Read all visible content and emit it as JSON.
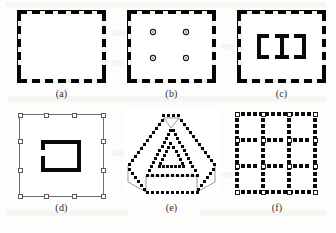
{
  "figure": {
    "background_color": "#fdfdfc",
    "ink_color": "#000000",
    "label_color": "#2b2b2b",
    "columns": 3,
    "rows": 2,
    "panel_count": 6
  },
  "panels": [
    {
      "id": "a",
      "label": "(a)",
      "shape_name": "dashed-rectangle",
      "description": "Landscape rectangle outlined with a thick black band broken by regular white dashes",
      "x": 17,
      "y": 10,
      "width": 89,
      "height": 73,
      "border_style": "thick-dashed-band",
      "border_thickness_px": 5,
      "dash_count_top": 12,
      "dash_count_side": 9,
      "interior": "empty",
      "interior_markers": 0
    },
    {
      "id": "b",
      "label": "(b)",
      "shape_name": "dashed-rectangle-with-four-dots",
      "description": "Same dashed rectangle border with four small hollow ring markers arranged in a 2 by 2 block inside",
      "x": 127,
      "y": 10,
      "width": 89,
      "height": 73,
      "border_style": "thick-dashed-band",
      "border_thickness_px": 5,
      "dash_count_top": 12,
      "dash_count_side": 9,
      "interior": "four-ring-markers",
      "interior_markers": 4,
      "marker_shape": "ring",
      "marker_positions": [
        {
          "x": 26,
          "y": 22
        },
        {
          "x": 59,
          "y": 22
        },
        {
          "x": 26,
          "y": 48
        },
        {
          "x": 59,
          "y": 48
        }
      ]
    },
    {
      "id": "c",
      "label": "(c)",
      "shape_name": "dashed-rectangle-with-bracket-i-bracket",
      "description": "Dashed rectangle border enclosing a bracket, I-beam, bracket glyph group drawn with thick black strokes",
      "x": 237,
      "y": 10,
      "width": 89,
      "height": 73,
      "border_style": "thick-dashed-band",
      "border_thickness_px": 5,
      "dash_count_top": 12,
      "dash_count_side": 9,
      "interior": "bracket-i-bracket",
      "interior_glyphs": [
        "left-bracket",
        "i-beam",
        "right-bracket"
      ]
    },
    {
      "id": "d",
      "label": "(d)",
      "shape_name": "thin-square-with-corner-markers-and-open-box",
      "description": "Thin grey square outline carrying small hollow square markers along its edges, with a thick open-sided box inside",
      "x": 17,
      "y": 112,
      "width": 89,
      "height": 87,
      "border_style": "thin-line-with-square-markers",
      "border_thickness_px": 1,
      "marker_shape": "hollow-square",
      "markers_per_edge": 4,
      "interior": "open-left-box",
      "interior_stroke_px": 4
    },
    {
      "id": "e",
      "label": "(e)",
      "shape_name": "dotted-triangular-prism",
      "description": "Three dimensional triangular prism seen in perspective, every edge stippled with square dots, inner triangular face outlined separately",
      "x": 124,
      "y": 108,
      "width": 95,
      "height": 91,
      "border_style": "square-dot-stipple",
      "dot_size_px": 3,
      "interior": "inner-triangle-outline",
      "faces": [
        "front-triangle",
        "top-left-face",
        "right-face",
        "bottom-face"
      ]
    },
    {
      "id": "f",
      "label": "(f)",
      "shape_name": "dotted-three-by-three-grid",
      "description": "Square frame subdivided into a three by three grid, all lines rendered as square dot runs with hollow white squares marking the intersections",
      "x": 233,
      "y": 110,
      "width": 88,
      "height": 86,
      "border_style": "square-dot-stipple",
      "dot_size_px": 4,
      "grid_columns": 3,
      "grid_rows": 3,
      "intersection_marker": "hollow-square",
      "intersection_count": 16
    }
  ]
}
